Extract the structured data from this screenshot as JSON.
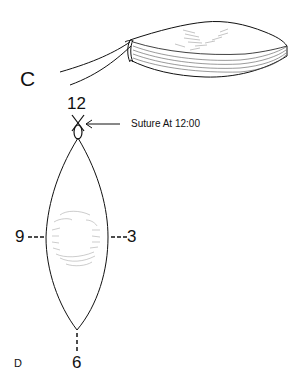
{
  "figure": {
    "panel_c": {
      "label": "C",
      "description": "lens-shaped disc with suture strand attached at one end"
    },
    "panel_d": {
      "label": "D",
      "clock_positions": {
        "top": "12",
        "right": "3",
        "bottom": "6",
        "left": "9"
      },
      "annotation": "Suture At 12:00"
    }
  },
  "colors": {
    "line": "#111111",
    "hatch": "#888888",
    "background": "#ffffff"
  }
}
